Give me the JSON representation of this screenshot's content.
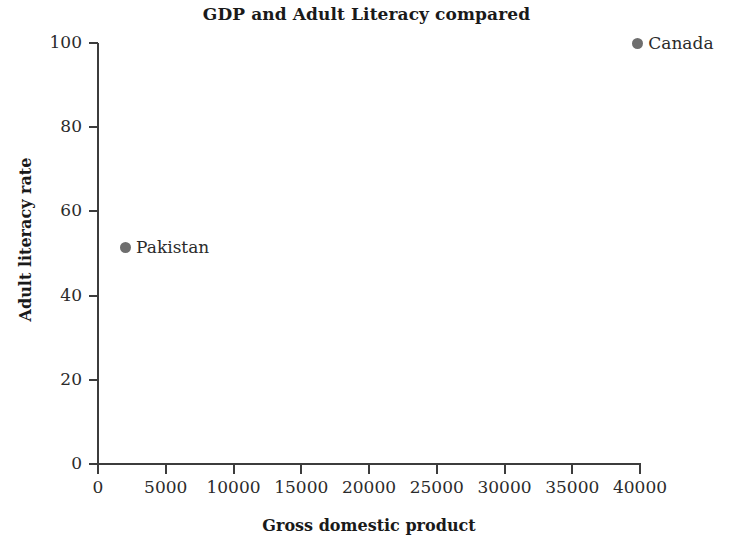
{
  "chart_data": {
    "type": "scatter",
    "title": "GDP and Adult Literacy compared",
    "xlabel": "Gross domestic product",
    "ylabel": "Adult literacy rate",
    "xlim": [
      0,
      40000
    ],
    "ylim": [
      0,
      100
    ],
    "xticks": [
      0,
      5000,
      10000,
      15000,
      20000,
      25000,
      30000,
      35000,
      40000
    ],
    "xtick_labels": [
      "0",
      "5000",
      "10000",
      "15000",
      "20000",
      "25000",
      "30000",
      "35000",
      "40000"
    ],
    "yticks": [
      0,
      20,
      40,
      60,
      80,
      100
    ],
    "ytick_labels": [
      "0",
      "20",
      "40",
      "60",
      "80",
      "100"
    ],
    "grid": false,
    "legend": "none",
    "marker_color": "#6e6e6e",
    "axis_color": "#3c3c3c",
    "background": "#ffffff",
    "points": [
      {
        "label": "Pakistan",
        "x": 2000,
        "y": 51.5
      },
      {
        "label": "Canada",
        "x": 39800,
        "y": 100
      }
    ]
  }
}
